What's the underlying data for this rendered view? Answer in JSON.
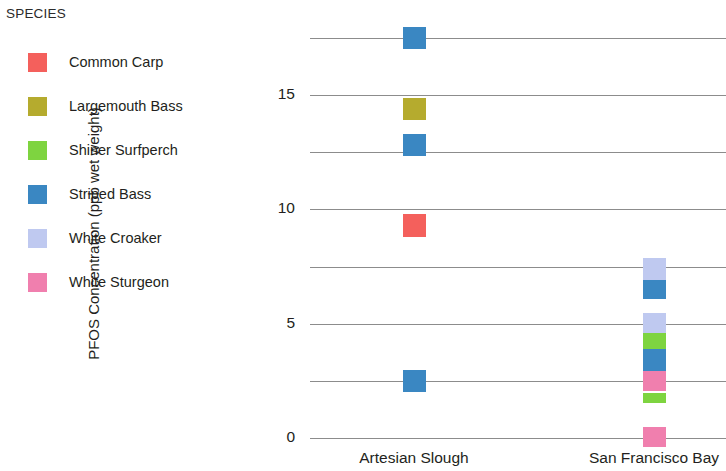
{
  "legend": {
    "title": "SPECIES",
    "items": [
      {
        "label": "Common Carp",
        "color": "#f4605c"
      },
      {
        "label": "Largemouth Bass",
        "color": "#b5ab2e"
      },
      {
        "label": "Shiner Surfperch",
        "color": "#7ed440"
      },
      {
        "label": "Striped Bass",
        "color": "#3a87c2"
      },
      {
        "label": "White Croaker",
        "color": "#bfc9f0"
      },
      {
        "label": "White Sturgeon",
        "color": "#f07fae"
      }
    ]
  },
  "chart_data": {
    "type": "scatter",
    "title": "",
    "xlabel": "",
    "ylabel": "PFOS Concentration (ppb wet weight)",
    "ylim": [
      0,
      17.5
    ],
    "ytick_labels": [
      "0",
      "5",
      "10",
      "15"
    ],
    "ytick_values": [
      0,
      5,
      10,
      15
    ],
    "gridlines": [
      0,
      2.5,
      5,
      7.5,
      10,
      12.5,
      15,
      17.5
    ],
    "grid": true,
    "legend_position": "top-left",
    "categories": [
      "Artesian Slough",
      "San Francisco Bay"
    ],
    "series": [
      {
        "name": "Common Carp",
        "color": "#f4605c"
      },
      {
        "name": "Largemouth Bass",
        "color": "#b5ab2e"
      },
      {
        "name": "Shiner Surfperch",
        "color": "#7ed440"
      },
      {
        "name": "Striped Bass",
        "color": "#3a87c2"
      },
      {
        "name": "White Croaker",
        "color": "#bfc9f0"
      },
      {
        "name": "White Sturgeon",
        "color": "#f07fae"
      }
    ],
    "points": [
      {
        "category": "Artesian Slough",
        "species": "Striped Bass",
        "value": 17.5,
        "color": "#3a87c2",
        "height": 1.0
      },
      {
        "category": "Artesian Slough",
        "species": "Largemouth Bass",
        "value": 14.4,
        "color": "#b5ab2e",
        "height": 1.0
      },
      {
        "category": "Artesian Slough",
        "species": "Striped Bass",
        "value": 12.8,
        "color": "#3a87c2",
        "height": 1.0
      },
      {
        "category": "Artesian Slough",
        "species": "Common Carp",
        "value": 9.3,
        "color": "#f4605c",
        "height": 1.05
      },
      {
        "category": "Artesian Slough",
        "species": "Striped Bass",
        "value": 2.5,
        "color": "#3a87c2",
        "height": 1.0
      },
      {
        "category": "San Francisco Bay",
        "species": "White Croaker",
        "value": 7.4,
        "color": "#bfc9f0",
        "height": 1.0
      },
      {
        "category": "San Francisco Bay",
        "species": "Striped Bass",
        "value": 6.5,
        "color": "#3a87c2",
        "height": 0.85
      },
      {
        "category": "San Francisco Bay",
        "species": "White Croaker",
        "value": 5.0,
        "color": "#bfc9f0",
        "height": 1.0
      },
      {
        "category": "San Francisco Bay",
        "species": "Shiner Surfperch",
        "value": 4.2,
        "color": "#7ed440",
        "height": 0.8
      },
      {
        "category": "San Francisco Bay",
        "species": "Striped Bass",
        "value": 3.4,
        "color": "#3a87c2",
        "height": 1.0
      },
      {
        "category": "San Francisco Bay",
        "species": "White Sturgeon",
        "value": 2.5,
        "color": "#f07fae",
        "height": 0.9
      },
      {
        "category": "San Francisco Bay",
        "species": "Shiner Surfperch",
        "value": 1.75,
        "color": "#7ed440",
        "height": 0.45
      },
      {
        "category": "San Francisco Bay",
        "species": "White Sturgeon",
        "value": 0.05,
        "color": "#f07fae",
        "height": 0.9
      }
    ]
  },
  "axes": {
    "x_labels": [
      "Artesian Slough",
      "San Francisco Bay"
    ]
  }
}
